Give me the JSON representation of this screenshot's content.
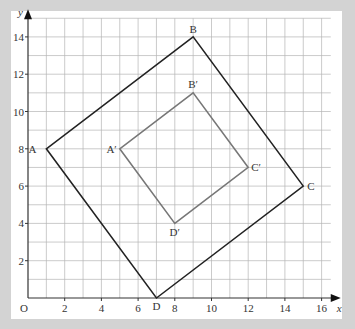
{
  "diagram": {
    "type": "coordinate-grid-enlargement",
    "axes": {
      "x_label": "x",
      "y_label": "y",
      "origin_label": "O",
      "x_ticks": [
        "2",
        "4",
        "6",
        "8",
        "10",
        "12",
        "14",
        "16"
      ],
      "y_ticks": [
        "2",
        "4",
        "6",
        "8",
        "10",
        "12",
        "14"
      ],
      "x_range": [
        0,
        16.5
      ],
      "y_range": [
        0,
        15
      ]
    },
    "shapes": [
      {
        "name": "ABCD",
        "color": "#222222",
        "vertices": [
          {
            "label": "A",
            "x": 1,
            "y": 8
          },
          {
            "label": "B",
            "x": 9,
            "y": 14
          },
          {
            "label": "C",
            "x": 15,
            "y": 6
          },
          {
            "label": "D",
            "x": 7,
            "y": 0
          }
        ]
      },
      {
        "name": "A'B'C'D'",
        "color": "#777777",
        "vertices": [
          {
            "label": "A′",
            "x": 5,
            "y": 8
          },
          {
            "label": "B′",
            "x": 9,
            "y": 11
          },
          {
            "label": "C′",
            "x": 12,
            "y": 7
          },
          {
            "label": "D′",
            "x": 8,
            "y": 4
          }
        ]
      }
    ],
    "colors": {
      "background": "#d3d3d3",
      "panel": "#ffffff",
      "grid": "#b5b5b5",
      "axis": "#333333"
    }
  }
}
